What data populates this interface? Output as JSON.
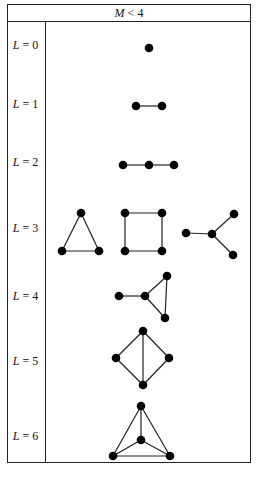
{
  "header": {
    "var": "M",
    "op": " < ",
    "value": "4"
  },
  "rows": [
    {
      "var": "L",
      "op": " = ",
      "value": "0",
      "y": 46
    },
    {
      "var": "L",
      "op": " = ",
      "value": "1",
      "y": 105
    },
    {
      "var": "L",
      "op": " = ",
      "value": "2",
      "y": 163
    },
    {
      "var": "L",
      "op": " = ",
      "value": "3",
      "y": 229
    },
    {
      "var": "L",
      "op": " = ",
      "value": "4",
      "y": 297
    },
    {
      "var": "L",
      "op": " = ",
      "value": "5",
      "y": 362
    },
    {
      "var": "L",
      "op": " = ",
      "value": "6",
      "y": 437
    }
  ],
  "graphs": [
    {
      "row": "L=0",
      "nodes": [
        [
          149,
          48
        ]
      ],
      "edges": []
    },
    {
      "row": "L=1",
      "nodes": [
        [
          136,
          106
        ],
        [
          162,
          106
        ]
      ],
      "edges": [
        [
          0,
          1
        ]
      ]
    },
    {
      "row": "L=2",
      "nodes": [
        [
          123,
          165
        ],
        [
          149,
          165
        ],
        [
          174,
          165
        ]
      ],
      "edges": [
        [
          0,
          1
        ],
        [
          1,
          2
        ]
      ]
    },
    {
      "row": "L=3 triangle",
      "nodes": [
        [
          81,
          213
        ],
        [
          62,
          251
        ],
        [
          99,
          251
        ]
      ],
      "edges": [
        [
          0,
          1
        ],
        [
          1,
          2
        ],
        [
          2,
          0
        ]
      ]
    },
    {
      "row": "L=3 square",
      "nodes": [
        [
          125,
          213
        ],
        [
          162,
          213
        ],
        [
          125,
          251
        ],
        [
          162,
          251
        ]
      ],
      "edges": [
        [
          0,
          1
        ],
        [
          1,
          3
        ],
        [
          3,
          2
        ],
        [
          2,
          0
        ]
      ]
    },
    {
      "row": "L=3 star",
      "nodes": [
        [
          186,
          233
        ],
        [
          212,
          234
        ],
        [
          234,
          214
        ],
        [
          233,
          255
        ]
      ],
      "edges": [
        [
          0,
          1
        ],
        [
          1,
          2
        ],
        [
          1,
          3
        ]
      ]
    },
    {
      "row": "L=4",
      "nodes": [
        [
          119,
          296
        ],
        [
          145,
          296
        ],
        [
          167,
          276
        ],
        [
          165,
          318
        ]
      ],
      "edges": [
        [
          0,
          1
        ],
        [
          1,
          2
        ],
        [
          1,
          3
        ],
        [
          2,
          3
        ]
      ]
    },
    {
      "row": "L=5",
      "nodes": [
        [
          143,
          331
        ],
        [
          116,
          358
        ],
        [
          169,
          358
        ],
        [
          143,
          385
        ]
      ],
      "edges": [
        [
          0,
          1
        ],
        [
          0,
          2
        ],
        [
          0,
          3
        ],
        [
          1,
          3
        ],
        [
          2,
          3
        ]
      ]
    },
    {
      "row": "L=6",
      "nodes": [
        [
          141,
          406
        ],
        [
          141,
          440
        ],
        [
          113,
          456
        ],
        [
          170,
          456
        ]
      ],
      "edges": [
        [
          0,
          1
        ],
        [
          0,
          2
        ],
        [
          0,
          3
        ],
        [
          1,
          2
        ],
        [
          1,
          3
        ],
        [
          2,
          3
        ]
      ]
    }
  ]
}
